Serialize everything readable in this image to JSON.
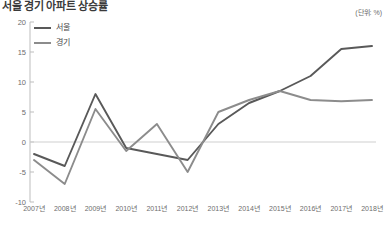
{
  "header": {
    "title": "서울 경기 아파트 상승률",
    "unit_label": "(단위: %)"
  },
  "legend": {
    "position": "top-left",
    "items": [
      {
        "label": "서울",
        "color": "#595959"
      },
      {
        "label": "경기",
        "color": "#8c8c8c"
      }
    ]
  },
  "axis": {
    "y_ticks": [
      "20",
      "15",
      "10",
      "5",
      "0",
      "-5",
      "-10"
    ],
    "x_ticks": [
      "2007년",
      "2008년",
      "2009년",
      "2010년",
      "2011년",
      "2012년",
      "2013년",
      "2014년",
      "2015년",
      "2016년",
      "2017년",
      "2018년"
    ]
  },
  "chart_data": {
    "type": "line",
    "title": "서울 경기 아파트 상승률",
    "xlabel": "",
    "ylabel": "",
    "unit": "%",
    "grid": false,
    "zero_line": true,
    "legend_position": "top-left",
    "ylim": [
      -10,
      20
    ],
    "ytick_values": [
      20,
      15,
      10,
      5,
      0,
      -5,
      -10
    ],
    "categories": [
      "2007년",
      "2008년",
      "2009년",
      "2010년",
      "2011년",
      "2012년",
      "2013년",
      "2014년",
      "2015년",
      "2016년",
      "2017년",
      "2018년"
    ],
    "series": [
      {
        "name": "서울",
        "color": "#595959",
        "values": [
          -2.0,
          -4.0,
          8.0,
          -1.0,
          -2.0,
          -3.0,
          3.0,
          6.5,
          8.5,
          11.0,
          15.5,
          16.0
        ]
      },
      {
        "name": "경기",
        "color": "#8c8c8c",
        "values": [
          -3.0,
          -7.0,
          5.5,
          -1.5,
          3.0,
          -5.0,
          5.0,
          7.0,
          8.5,
          7.0,
          6.8,
          7.0
        ]
      }
    ]
  }
}
